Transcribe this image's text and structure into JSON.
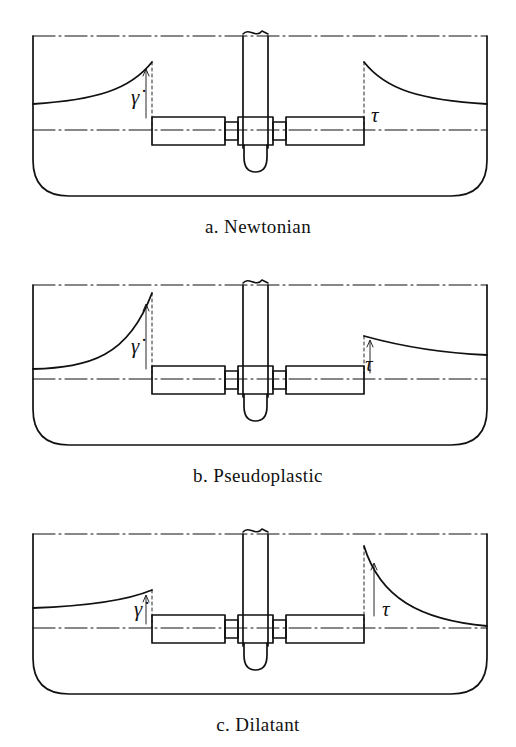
{
  "figure": {
    "background_color": "#ffffff",
    "line_color": "#111111",
    "width": 516,
    "height": 747
  },
  "symbols": {
    "shear_rate": "γ̇",
    "shear_stress": "τ"
  },
  "panels": [
    {
      "id": "a",
      "caption": "a. Newtonian",
      "fluid_type": "Newtonian",
      "left_profile_symbol": "γ̇",
      "right_profile_symbol": "τ",
      "left_curve_description": "gradual rise from wall then steep rise to impeller tip",
      "right_curve_description": "steep fall from impeller tip then gradual decay to wall",
      "left_amplitude": "medium",
      "right_amplitude": "medium"
    },
    {
      "id": "b",
      "caption": "b. Pseudoplastic",
      "fluid_type": "Pseudoplastic",
      "left_profile_symbol": "γ̇",
      "right_profile_symbol": "τ",
      "left_curve_description": "very steep exponential rise to a tall peak at impeller tip",
      "right_curve_description": "small shallow decay from a low peak at impeller tip",
      "left_amplitude": "large",
      "right_amplitude": "small"
    },
    {
      "id": "c",
      "caption": "c. Dilatant",
      "fluid_type": "Dilatant",
      "left_profile_symbol": "γ̇",
      "right_profile_symbol": "τ",
      "left_curve_description": "shallow gradual rise to a low peak at impeller tip",
      "right_curve_description": "very tall peak at impeller tip decaying steeply toward the wall",
      "left_amplitude": "small",
      "right_amplitude": "large"
    }
  ],
  "vessel": {
    "name": "mixing tank with dished bottom",
    "surface_line_style": "dash-dot",
    "centerline_style": "dash-dot",
    "bottom": "flat with large rounded corners"
  },
  "impeller": {
    "name": "paddle impeller on vertical shaft",
    "shaft": "vertical shaft with break symbol at top",
    "blades": 2,
    "hub": "central hub with rounded nose below"
  }
}
